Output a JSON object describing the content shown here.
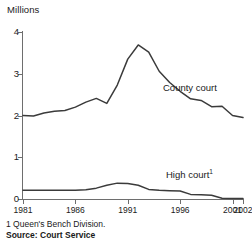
{
  "chart_data": {
    "type": "line",
    "title": "",
    "subtitle": "",
    "xlabel": "",
    "ylabel": "Millions",
    "ylim": [
      0,
      4
    ],
    "xlim": [
      1981,
      2002
    ],
    "yticks": [
      0,
      1,
      2,
      3,
      4
    ],
    "xticks": [
      1981,
      1986,
      1991,
      1996,
      2001,
      2002
    ],
    "ytick_labels": [
      "0",
      "1",
      "2",
      "3",
      "4"
    ],
    "xtick_labels": [
      "1981",
      "1986",
      "1991",
      "1996",
      "2001",
      "2002"
    ],
    "grid": false,
    "legend_position": "inline-annotation",
    "x": [
      1981,
      1982,
      1983,
      1984,
      1985,
      1986,
      1987,
      1988,
      1989,
      1990,
      1991,
      1992,
      1993,
      1994,
      1995,
      1996,
      1997,
      1998,
      1999,
      2000,
      2001,
      2002
    ],
    "series": [
      {
        "name": "County court",
        "color": "#3b3b3b",
        "values": [
          2.0,
          1.99,
          2.06,
          2.1,
          2.12,
          2.2,
          2.32,
          2.41,
          2.29,
          2.73,
          3.35,
          3.69,
          3.52,
          3.06,
          2.79,
          2.58,
          2.4,
          2.36,
          2.21,
          2.22,
          2.0,
          1.95
        ]
      },
      {
        "name": "High court",
        "color": "#3b3b3b",
        "footnote_marker": "1",
        "values": [
          0.21,
          0.21,
          0.21,
          0.21,
          0.21,
          0.21,
          0.22,
          0.26,
          0.33,
          0.38,
          0.37,
          0.33,
          0.23,
          0.21,
          0.2,
          0.19,
          0.11,
          0.1,
          0.09,
          0.02,
          0.01,
          0.01
        ]
      }
    ],
    "annotations": [
      {
        "text": "County court",
        "x": 1996,
        "y": 2.9
      },
      {
        "text": "High court",
        "x": 1996,
        "y": 0.75,
        "superscript": "1"
      }
    ]
  },
  "footnotes": {
    "note_1": "1 Queen's Bench Division.",
    "source": "Source: Court Service"
  },
  "labels": {
    "county_court": "County court",
    "high_court": "High court",
    "high_court_marker": "1",
    "millions": "Millions"
  }
}
